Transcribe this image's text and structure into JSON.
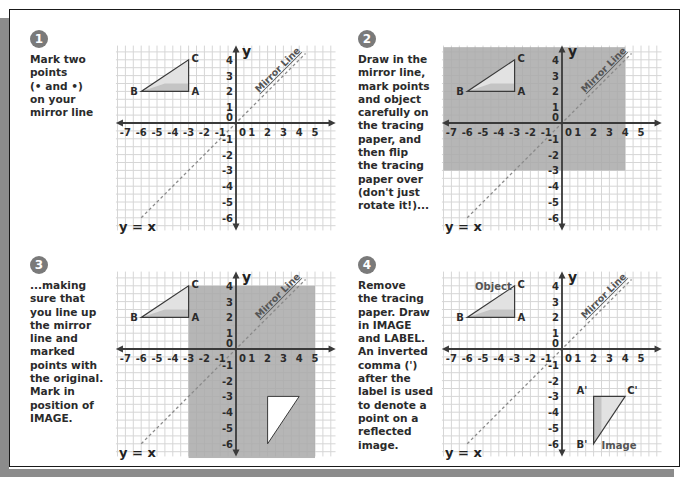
{
  "colors": {
    "grid": "#d6d6d6",
    "axis": "#3a3a3a",
    "tracing_shade": "#a9a9a9",
    "triangle_fill_light": "#e2e2e2",
    "triangle_fill_dark": "#c4c4c4",
    "mirror_line": "#8a8a8a",
    "badge": "#7a7a7a",
    "frame_shadow": "#8c8c8c"
  },
  "axes": {
    "x_label": "x",
    "y_label": "y",
    "x_ticks": [
      "-7",
      "-6",
      "-5",
      "-4",
      "-3",
      "-2",
      "-1",
      "0",
      "1",
      "2",
      "3",
      "4",
      "5"
    ],
    "y_ticks": [
      "4",
      "3",
      "2",
      "1",
      "0",
      "-1",
      "-2",
      "-3",
      "-4",
      "-5",
      "-6"
    ],
    "mirror_line_label": "Mirror Line",
    "equation_label": "y = x"
  },
  "object": {
    "points": [
      {
        "label": "A",
        "x": -3,
        "y": 2
      },
      {
        "label": "B",
        "x": -6,
        "y": 2
      },
      {
        "label": "C",
        "x": -3,
        "y": 4
      }
    ]
  },
  "image": {
    "points": [
      {
        "label": "A'",
        "x": 2,
        "y": -3
      },
      {
        "label": "B'",
        "x": 2,
        "y": -6
      },
      {
        "label": "C'",
        "x": 4,
        "y": -3
      }
    ]
  },
  "panels": [
    {
      "number": "1",
      "text": "Mark two\npoints\n(• and •)\non your\nmirror line",
      "tracing": null,
      "show_image_blank": false,
      "show_image_final": false,
      "object_label": "",
      "image_label": ""
    },
    {
      "number": "2",
      "text": "Draw in the\nmirror line,\nmark points\nand object\ncarefully on\nthe tracing\npaper, and\nthen flip\nthe tracing\npaper over\n(don't just\nrotate it!)...",
      "tracing": {
        "x0": -7.5,
        "x1": 4,
        "y0": -3,
        "y1": 4.8
      },
      "show_image_blank": false,
      "show_image_final": false,
      "object_label": "",
      "image_label": ""
    },
    {
      "number": "3",
      "text": "...making\nsure that\nyou line up\nthe mirror\nline and\nmarked\npoints with\nthe original.\nMark in\nposition of\nIMAGE.",
      "tracing": {
        "x0": -3,
        "x1": 5,
        "y0": -6.9,
        "y1": 4
      },
      "show_image_blank": true,
      "show_image_final": false,
      "object_label": "",
      "image_label": ""
    },
    {
      "number": "4",
      "text": "Remove\nthe tracing\npaper. Draw\nin IMAGE\nand LABEL.\nAn inverted\ncomma (')\nafter the\nlabel is used\nto denote a\npoint on a\nreflected\nimage.",
      "tracing": null,
      "show_image_blank": false,
      "show_image_final": true,
      "object_label": "Object",
      "image_label": "Image"
    }
  ]
}
